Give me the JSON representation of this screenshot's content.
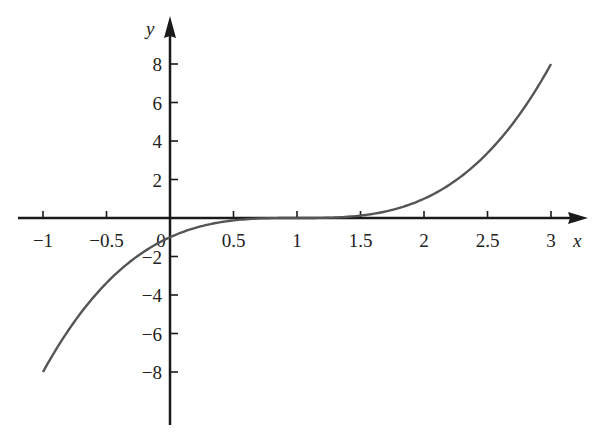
{
  "chart_data": {
    "type": "line",
    "title": "",
    "function": "y = (x - 1)^3",
    "xlabel": "x",
    "ylabel": "y",
    "xlim": [
      -1,
      3
    ],
    "ylim": [
      -8,
      8
    ],
    "grid": false,
    "legend": null,
    "x_ticks": [
      -1,
      -0.5,
      0,
      0.5,
      1,
      1.5,
      2,
      2.5,
      3
    ],
    "x_tick_labels": [
      "−1",
      "−0.5",
      "0",
      "0.5",
      "1",
      "1.5",
      "2",
      "2.5",
      "3"
    ],
    "y_ticks": [
      -8,
      -6,
      -4,
      -2,
      2,
      4,
      6,
      8
    ],
    "y_tick_labels": [
      "−8",
      "−6",
      "−4",
      "−2",
      "2",
      "4",
      "6",
      "8"
    ],
    "series": [
      {
        "name": "y = (x-1)^3",
        "x": [
          -1,
          -0.5,
          0,
          0.5,
          1,
          1.5,
          2,
          2.5,
          3
        ],
        "y": [
          -8,
          -3.375,
          -1,
          -0.125,
          0,
          0.125,
          1,
          3.375,
          8
        ]
      }
    ],
    "colors": {
      "curve": "#555555",
      "axes": "#1a1a1a",
      "text": "#222222"
    }
  }
}
